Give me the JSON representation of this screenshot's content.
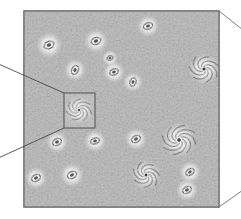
{
  "figure": {
    "kind": "scientific-illustration",
    "background_color": "#ffffff"
  },
  "panel": {
    "name": "sky-field-panel",
    "x": 24,
    "y": 11,
    "width": 195,
    "height": 196,
    "border_color": "#6d6d6d",
    "border_width": 1.2,
    "fill_color": "#bdbdbd",
    "noise_description": "mottled grey speckle texture"
  },
  "inset_box": {
    "name": "magnifier-selection-box",
    "x": 64,
    "y": 93,
    "width": 31,
    "height": 35,
    "border_color": "#5a5a5a",
    "border_width": 1.1,
    "fill_color": "rgba(255,255,255,0.10)"
  },
  "callout_lines": [
    {
      "name": "callout-line-upper",
      "x1": 64,
      "y1": 93,
      "x2": -6,
      "y2": 62,
      "color": "#4a4a4a",
      "width": 0.9
    },
    {
      "name": "callout-line-lower",
      "x1": 64,
      "y1": 128,
      "x2": -6,
      "y2": 160,
      "color": "#4a4a4a",
      "width": 0.9
    }
  ],
  "perspective_lines": [
    {
      "name": "perspective-line-top-right",
      "x1": 219,
      "y1": 11,
      "x2": 243,
      "y2": 30,
      "color": "#6d6d6d",
      "width": 0.9
    },
    {
      "name": "perspective-line-bottom-right",
      "x1": 219,
      "y1": 207,
      "x2": 243,
      "y2": 190,
      "color": "#6d6d6d",
      "width": 0.9
    }
  ],
  "chart_data": {
    "type": "scatter",
    "xlabel": "",
    "ylabel": "",
    "xlim": [
      24,
      219
    ],
    "ylim": [
      11,
      207
    ],
    "grid": false,
    "legend": "none",
    "categories": [
      "elliptical",
      "spiral"
    ],
    "annotations": [
      "zoom inset box around central spiral galaxy",
      "two callout lines extend off the left edge",
      "two short perspective lines at right corners"
    ],
    "points": [
      {
        "id": "g01",
        "x": 49,
        "y": 45,
        "type": "elliptical",
        "rx": 5.2,
        "ry": 3.6,
        "angle": -25,
        "halo": 13
      },
      {
        "id": "g02",
        "x": 96,
        "y": 41,
        "type": "elliptical",
        "rx": 5.0,
        "ry": 3.4,
        "angle": -18,
        "halo": 12
      },
      {
        "id": "g03",
        "x": 148,
        "y": 26,
        "type": "elliptical",
        "rx": 4.6,
        "ry": 3.1,
        "angle": -20,
        "halo": 11
      },
      {
        "id": "g04",
        "x": 75,
        "y": 70,
        "type": "elliptical",
        "rx": 4.6,
        "ry": 3.2,
        "angle": -62,
        "halo": 11
      },
      {
        "id": "g05",
        "x": 114,
        "y": 72,
        "type": "elliptical",
        "rx": 4.4,
        "ry": 3.0,
        "angle": -22,
        "halo": 11
      },
      {
        "id": "g06",
        "x": 133,
        "y": 82,
        "type": "elliptical",
        "rx": 4.2,
        "ry": 3.0,
        "angle": -70,
        "halo": 10
      },
      {
        "id": "g07",
        "x": 204,
        "y": 69,
        "type": "spiral",
        "r": 14,
        "arms": 7,
        "angle": 20,
        "halo": 16
      },
      {
        "id": "g08",
        "x": 79,
        "y": 110,
        "type": "spiral",
        "r": 12,
        "arms": 7,
        "angle": 5,
        "halo": 14,
        "inset": true
      },
      {
        "id": "g09",
        "x": 57,
        "y": 142,
        "type": "elliptical",
        "rx": 4.6,
        "ry": 3.2,
        "angle": -30,
        "halo": 11
      },
      {
        "id": "g10",
        "x": 95,
        "y": 141,
        "type": "elliptical",
        "rx": 4.4,
        "ry": 2.9,
        "angle": -18,
        "halo": 11
      },
      {
        "id": "g11",
        "x": 136,
        "y": 139,
        "type": "elliptical",
        "rx": 4.6,
        "ry": 3.2,
        "angle": -28,
        "halo": 11
      },
      {
        "id": "g12",
        "x": 179,
        "y": 140,
        "type": "spiral",
        "r": 16,
        "arms": 8,
        "angle": -10,
        "halo": 18
      },
      {
        "id": "g13",
        "x": 36,
        "y": 178,
        "type": "elliptical",
        "rx": 4.6,
        "ry": 3.2,
        "angle": -30,
        "halo": 11
      },
      {
        "id": "g14",
        "x": 72,
        "y": 175,
        "type": "elliptical",
        "rx": 4.8,
        "ry": 3.3,
        "angle": -25,
        "halo": 12
      },
      {
        "id": "g15",
        "x": 146,
        "y": 175,
        "type": "spiral",
        "r": 13,
        "arms": 7,
        "angle": 35,
        "halo": 15
      },
      {
        "id": "g16",
        "x": 190,
        "y": 172,
        "type": "elliptical",
        "rx": 4.4,
        "ry": 3.0,
        "angle": -35,
        "halo": 11
      },
      {
        "id": "g17",
        "x": 187,
        "y": 190,
        "type": "elliptical",
        "rx": 4.6,
        "ry": 3.1,
        "angle": -30,
        "halo": 11
      },
      {
        "id": "g18",
        "x": 110,
        "y": 58,
        "type": "elliptical",
        "rx": 3.2,
        "ry": 2.2,
        "angle": -20,
        "halo": 8
      }
    ]
  },
  "colors": {
    "galaxy_core": "#3a3a3a",
    "galaxy_ring": "#4a4a4a",
    "halo": "#ffffff",
    "field_base": "#b9b9b9",
    "outline": "#6d6d6d"
  }
}
